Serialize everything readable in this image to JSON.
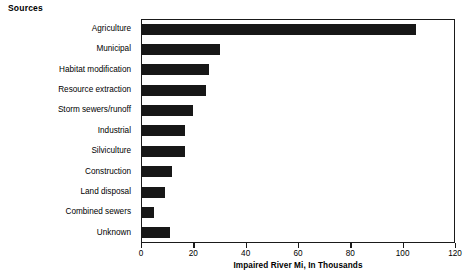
{
  "page_title": "Sources",
  "chart_data": {
    "type": "bar",
    "orientation": "horizontal",
    "title": "Sources",
    "xlabel": "Impaired River Mi, In Thousands",
    "ylabel": "",
    "xlim": [
      0,
      120
    ],
    "xticks": [
      0,
      20,
      40,
      60,
      80,
      100,
      120
    ],
    "grid": false,
    "legend": false,
    "bar_color": "#171717",
    "frame_color": "#1a1a1a",
    "categories": [
      "Agriculture",
      "Municipal",
      "Habitat modification",
      "Resource extraction",
      "Storm sewers/runoff",
      "Industrial",
      "Silviculture",
      "Construction",
      "Land disposal",
      "Combined sewers",
      "Unknown"
    ],
    "values": [
      105,
      30,
      26,
      25,
      20,
      17,
      17,
      12,
      9,
      5,
      11
    ]
  }
}
